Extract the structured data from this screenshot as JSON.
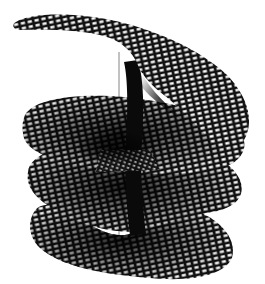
{
  "figure": {
    "colors": {
      "background": "#ffffff",
      "mesh": "#111111",
      "cell": "#ffffff",
      "axis": "#555555"
    },
    "sheets": 4
  }
}
